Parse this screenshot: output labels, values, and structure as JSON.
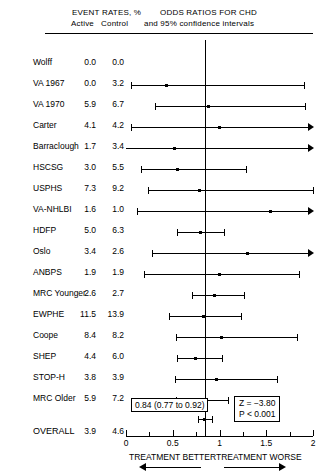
{
  "header": {
    "event_rates_title": "EVENT RATES, %",
    "active_label": "Active",
    "control_label": "Control",
    "odds_title": "ODDS RATIOS FOR CHD",
    "ci_subtitle": "and 95% confidence intervals"
  },
  "footer": {
    "better_label": "TREATMENT BETTER",
    "worse_label": "TREATMENT WORSE",
    "overall_estimate": "0.84 (0.77 to 0.92)",
    "z_statistic": "Z = −3.80",
    "p_value": "P < 0.001"
  },
  "chart_data": {
    "type": "forest",
    "title": "ODDS RATIOS FOR CHD",
    "subtitle": "and 95% confidence intervals",
    "xlabel": "Odds Ratio",
    "ylabel": "",
    "xlim": [
      0,
      2
    ],
    "grid": false,
    "reference_line": 1,
    "tick_labels": [
      "0",
      "0.5",
      "1",
      "1.5",
      "2"
    ],
    "tick_values": [
      0,
      0.5,
      1,
      1.5,
      2
    ],
    "minor_tick_values": [
      0.25,
      0.75,
      1.25,
      1.75
    ],
    "columns": [
      "Study",
      "Active",
      "Control",
      "Odds Ratio",
      "95% CI low",
      "95% CI high"
    ],
    "rows": [
      {
        "study": "Wolff",
        "active": "0.0",
        "control": "0.0",
        "or": null,
        "lo": null,
        "hi": null,
        "hi_arrow": false
      },
      {
        "study": "VA 1967",
        "active": "0.0",
        "control": "3.2",
        "or": 0.43,
        "lo": 0.05,
        "hi": 1.9,
        "hi_arrow": false
      },
      {
        "study": "VA 1970",
        "active": "5.9",
        "control": "6.7",
        "or": 0.88,
        "lo": 0.31,
        "hi": 1.91,
        "hi_arrow": false
      },
      {
        "study": "Carter",
        "active": "4.1",
        "control": "4.2",
        "or": 1.0,
        "lo": 0.05,
        "hi": 2.0,
        "hi_arrow": true
      },
      {
        "study": "Barraclough",
        "active": "1.7",
        "control": "3.4",
        "or": 0.52,
        "lo": 0.0,
        "hi": 2.0,
        "hi_arrow": true
      },
      {
        "study": "HSCSG",
        "active": "3.0",
        "control": "5.5",
        "or": 0.55,
        "lo": 0.16,
        "hi": 1.28,
        "hi_arrow": false
      },
      {
        "study": "USPHS",
        "active": "7.3",
        "control": "9.2",
        "or": 0.79,
        "lo": 0.24,
        "hi": 2.0,
        "hi_arrow": false
      },
      {
        "study": "VA-NHLBI",
        "active": "1.6",
        "control": "1.0",
        "or": 1.55,
        "lo": 0.12,
        "hi": 2.0,
        "hi_arrow": true
      },
      {
        "study": "HDFP",
        "active": "5.0",
        "control": "6.3",
        "or": 0.8,
        "lo": 0.55,
        "hi": 1.05,
        "hi_arrow": false
      },
      {
        "study": "Oslo",
        "active": "3.4",
        "control": "2.6",
        "or": 1.3,
        "lo": 0.28,
        "hi": 2.0,
        "hi_arrow": true
      },
      {
        "study": "ANBPS",
        "active": "1.9",
        "control": "1.9",
        "or": 1.0,
        "lo": 0.19,
        "hi": 1.85,
        "hi_arrow": false
      },
      {
        "study": "MRC Younger",
        "active": "2.6",
        "control": "2.7",
        "or": 0.95,
        "lo": 0.71,
        "hi": 1.26,
        "hi_arrow": false
      },
      {
        "study": "EWPHE",
        "active": "11.5",
        "control": "13.9",
        "or": 0.83,
        "lo": 0.46,
        "hi": 1.23,
        "hi_arrow": false
      },
      {
        "study": "Coope",
        "active": "8.4",
        "control": "8.2",
        "or": 1.02,
        "lo": 0.54,
        "hi": 1.83,
        "hi_arrow": false
      },
      {
        "study": "SHEP",
        "active": "4.4",
        "control": "6.0",
        "or": 0.74,
        "lo": 0.55,
        "hi": 1.03,
        "hi_arrow": false
      },
      {
        "study": "STOP-H",
        "active": "3.8",
        "control": "3.9",
        "or": 0.97,
        "lo": 0.52,
        "hi": 1.61,
        "hi_arrow": false
      },
      {
        "study": "MRC Older",
        "active": "5.9",
        "control": "7.2",
        "or": 0.81,
        "lo": 0.53,
        "hi": 1.09,
        "hi_arrow": false
      }
    ],
    "overall": {
      "study": "OVERALL",
      "active": "3.9",
      "control": "4.6",
      "or": 0.84,
      "lo": 0.77,
      "hi": 0.92,
      "label": "0.84 (0.77 to 0.92)",
      "z": "Z = −3.80",
      "p": "P < 0.001"
    }
  }
}
